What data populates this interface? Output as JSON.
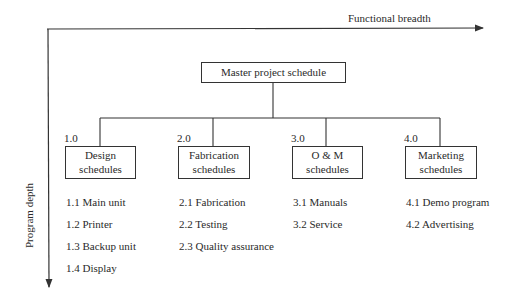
{
  "axes": {
    "horizontal_label": "Functional breadth",
    "vertical_label": "Program depth"
  },
  "root": {
    "label": "Master project schedule"
  },
  "branches": [
    {
      "number": "1.0",
      "title_lines": [
        "Design",
        "schedules"
      ],
      "items": [
        "1.1 Main unit",
        "1.2 Printer",
        "1.3 Backup unit",
        "1.4 Display"
      ]
    },
    {
      "number": "2.0",
      "title_lines": [
        "Fabrication",
        "schedules"
      ],
      "items": [
        "2.1 Fabrication",
        "2.2 Testing",
        "2.3 Quality assurance"
      ]
    },
    {
      "number": "3.0",
      "title_lines": [
        "O & M",
        "schedules"
      ],
      "items": [
        "3.1 Manuals",
        "3.2 Service"
      ]
    },
    {
      "number": "4.0",
      "title_lines": [
        "Marketing",
        "schedules"
      ],
      "items": [
        "4.1 Demo program",
        "4.2 Advertising"
      ]
    }
  ]
}
